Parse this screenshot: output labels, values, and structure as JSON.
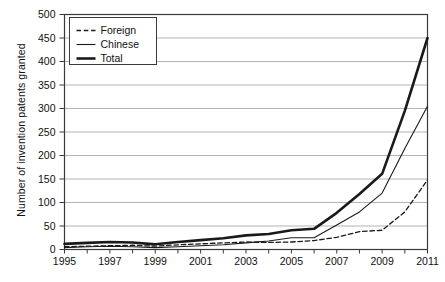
{
  "chart_data": {
    "type": "line",
    "title": "",
    "xlabel": "",
    "ylabel": "Number of invention patents granted",
    "x": [
      1995,
      1996,
      1997,
      1998,
      1999,
      2000,
      2001,
      2002,
      2003,
      2004,
      2005,
      2006,
      2007,
      2008,
      2009,
      2010,
      2011
    ],
    "xlim": [
      1995,
      2011
    ],
    "ylim": [
      0,
      500
    ],
    "ytick_labels": [
      "0",
      "50",
      "100",
      "150",
      "200",
      "250",
      "300",
      "350",
      "400",
      "450",
      "500"
    ],
    "yticks": [
      0,
      50,
      100,
      150,
      200,
      250,
      300,
      350,
      400,
      450,
      500
    ],
    "xtick_labels": [
      "1995",
      "1997",
      "1999",
      "2001",
      "2003",
      "2005",
      "2007",
      "2009",
      "2011"
    ],
    "xticks": [
      1995,
      1997,
      1999,
      2001,
      2003,
      2005,
      2007,
      2009,
      2011
    ],
    "grid": "horizontal",
    "legend_position": "top-left",
    "series": [
      {
        "name": "Foreign",
        "style": "dashed",
        "color": "#1a1a1a",
        "values": [
          6,
          7,
          8,
          9,
          7,
          10,
          12,
          14,
          16,
          15,
          16,
          19,
          26,
          38,
          41,
          80,
          148
        ]
      },
      {
        "name": "Chinese",
        "style": "thin-solid",
        "color": "#1a1a1a",
        "values": [
          4,
          6,
          7,
          6,
          4,
          6,
          8,
          10,
          14,
          18,
          25,
          25,
          52,
          80,
          120,
          215,
          305
        ]
      },
      {
        "name": "Total",
        "style": "thick-solid",
        "color": "#1a1a1a",
        "values": [
          12,
          14,
          16,
          15,
          11,
          16,
          20,
          24,
          30,
          33,
          41,
          44,
          78,
          118,
          161,
          295,
          450
        ]
      }
    ]
  },
  "legend": {
    "items": [
      {
        "label": "Foreign",
        "style": "dashed"
      },
      {
        "label": "Chinese",
        "style": "thin-solid"
      },
      {
        "label": "Total",
        "style": "thick-solid"
      }
    ]
  },
  "axes": {
    "y_title": "Number of invention patents granted"
  }
}
